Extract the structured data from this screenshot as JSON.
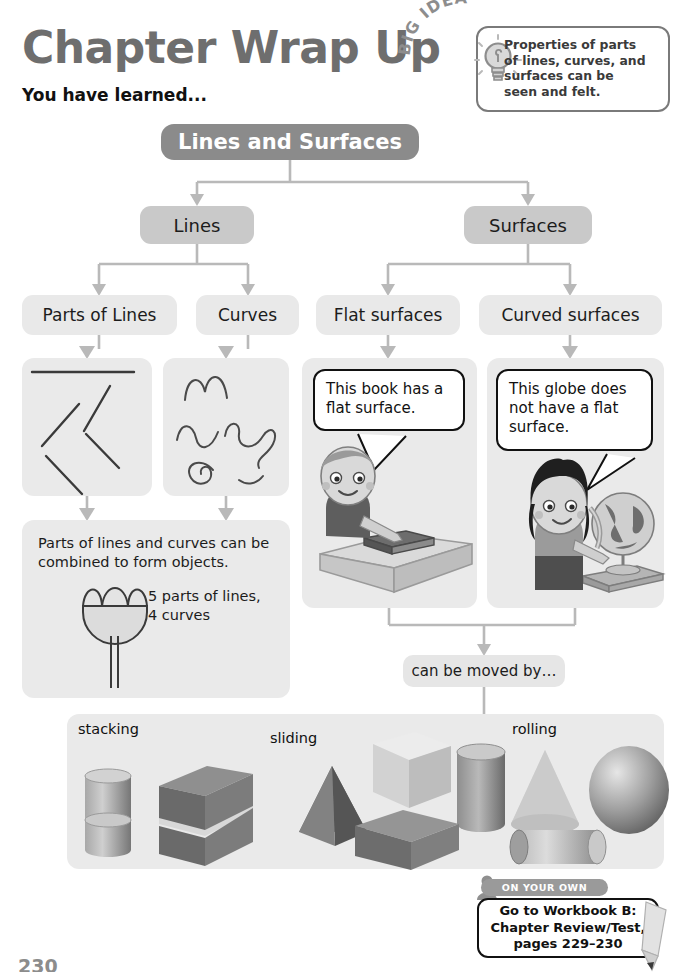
{
  "page": {
    "title": "Chapter Wrap Up",
    "subtitle": "You have learned...",
    "page_number": "230"
  },
  "big_idea": {
    "label": "BIG IDEA",
    "icon": "lightbulb-icon",
    "text": "Properties of parts\nof lines, curves, and\nsurfaces can be\nseen and felt."
  },
  "flow": {
    "root": "Lines and Surfaces",
    "level2": [
      {
        "label": "Lines"
      },
      {
        "label": "Surfaces"
      }
    ],
    "level3": [
      {
        "label": "Parts of Lines"
      },
      {
        "label": "Curves"
      },
      {
        "label": "Flat surfaces"
      },
      {
        "label": "Curved surfaces"
      }
    ],
    "moved_by": "can be moved by…"
  },
  "panels": {
    "lines_illustration": "line-segments-illustration",
    "curves_illustration": "curves-illustration",
    "combine": {
      "text": "Parts of lines and curves can be\ncombined to form objects.",
      "count": "5 parts of lines,\n4 curves",
      "illustration": "tulip-flower-illustration"
    },
    "book": {
      "bubble": "This book has a\nflat surface.",
      "illustration": "boy-with-book-on-table-illustration"
    },
    "globe": {
      "bubble": "This globe does\nnot have a flat\nsurface.",
      "illustration": "girl-with-globe-illustration"
    }
  },
  "shapes_panel": {
    "groups": [
      {
        "label": "stacking",
        "shapes": [
          "cylinder",
          "cylinder",
          "rectangular-prism",
          "rectangular-prism"
        ]
      },
      {
        "label": "sliding",
        "shapes": [
          "pyramid",
          "cube",
          "cylinder",
          "rectangular-prism"
        ]
      },
      {
        "label": "rolling",
        "shapes": [
          "cone",
          "sphere",
          "cylinder"
        ]
      }
    ]
  },
  "on_your_own": {
    "tab_label": "ON YOUR OWN",
    "text": "Go to Workbook B:\nChapter Review/Test,\npages 229–230",
    "icon": "pencil-icon"
  },
  "colors": {
    "title_gray": "#6e6e6e",
    "root_box": "#8b8b8b",
    "level2_box": "#c9c9c9",
    "level3_box": "#e9e9e9",
    "panel_bg": "#eaeaea",
    "connector": "#b9b9b9"
  }
}
